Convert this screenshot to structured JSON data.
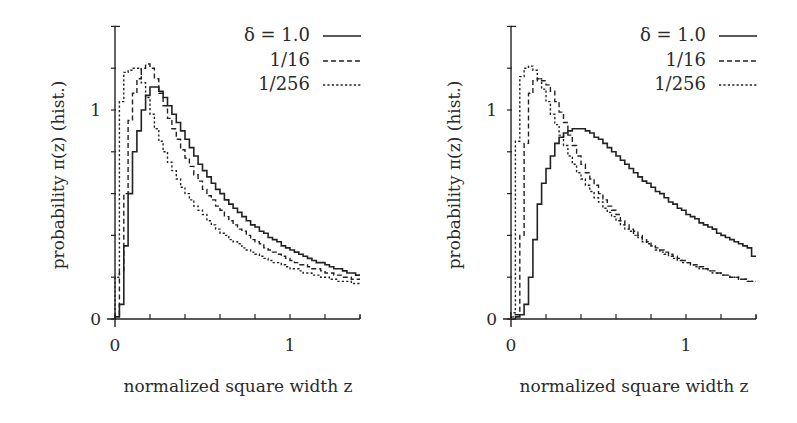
{
  "figure": {
    "panels": [
      {
        "id": "left",
        "ylabel": "probability π(z) (hist.)",
        "xlabel": "normalized square width z",
        "xticks": [
          {
            "value": 0,
            "label": "0"
          },
          {
            "value": 1,
            "label": "1"
          }
        ],
        "yticks": [
          {
            "value": 0,
            "label": "0"
          },
          {
            "value": 1,
            "label": "1"
          }
        ],
        "legend": [
          {
            "label": "δ = 1.0",
            "style": "solid"
          },
          {
            "label": "1/16",
            "style": "dashed"
          },
          {
            "label": "1/256",
            "style": "dotted"
          }
        ]
      },
      {
        "id": "right",
        "ylabel": "probability π(z) (hist.)",
        "xlabel": "normalized square width z",
        "xticks": [
          {
            "value": 0,
            "label": "0"
          },
          {
            "value": 1,
            "label": "1"
          }
        ],
        "yticks": [
          {
            "value": 0,
            "label": "0"
          },
          {
            "value": 1,
            "label": "1"
          }
        ],
        "legend": [
          {
            "label": "δ = 1.0",
            "style": "solid"
          },
          {
            "label": "1/16",
            "style": "dashed"
          },
          {
            "label": "1/256",
            "style": "dotted"
          }
        ]
      }
    ]
  },
  "chart_data": [
    {
      "type": "line",
      "subtype": "step-histogram",
      "title": "",
      "xlabel": "normalized square width z",
      "ylabel": "probability π(z) (hist.)",
      "xlim": [
        0,
        1.4
      ],
      "ylim": [
        0,
        1.4
      ],
      "x_major_ticks": [
        0,
        1
      ],
      "x_minor_ticks": [
        0.2,
        0.4,
        0.6,
        0.8,
        1.2,
        1.4
      ],
      "y_major_ticks": [
        0,
        1
      ],
      "y_minor_ticks": [
        0.2,
        0.4,
        0.6,
        0.8,
        1.2,
        1.4
      ],
      "grid": false,
      "legend_position": "upper right",
      "bin_width": 0.025,
      "x": [
        0.0,
        0.025,
        0.05,
        0.075,
        0.1,
        0.125,
        0.15,
        0.175,
        0.2,
        0.225,
        0.25,
        0.275,
        0.3,
        0.325,
        0.35,
        0.375,
        0.4,
        0.425,
        0.45,
        0.475,
        0.5,
        0.525,
        0.55,
        0.575,
        0.6,
        0.625,
        0.65,
        0.675,
        0.7,
        0.725,
        0.75,
        0.775,
        0.8,
        0.825,
        0.85,
        0.875,
        0.9,
        0.925,
        0.95,
        0.975,
        1.0,
        1.025,
        1.05,
        1.075,
        1.1,
        1.125,
        1.15,
        1.175,
        1.2,
        1.225,
        1.25,
        1.275,
        1.3,
        1.325,
        1.35,
        1.375
      ],
      "series": [
        {
          "name": "δ = 1.0",
          "style": "solid",
          "values": [
            0.01,
            0.07,
            0.35,
            0.6,
            0.8,
            0.9,
            1.0,
            1.07,
            1.11,
            1.11,
            1.09,
            1.06,
            1.02,
            0.98,
            0.94,
            0.9,
            0.86,
            0.82,
            0.78,
            0.74,
            0.71,
            0.68,
            0.65,
            0.62,
            0.6,
            0.57,
            0.55,
            0.53,
            0.51,
            0.49,
            0.47,
            0.45,
            0.44,
            0.42,
            0.41,
            0.39,
            0.38,
            0.37,
            0.35,
            0.34,
            0.33,
            0.32,
            0.31,
            0.3,
            0.29,
            0.28,
            0.27,
            0.27,
            0.26,
            0.25,
            0.24,
            0.24,
            0.23,
            0.22,
            0.22,
            0.21
          ]
        },
        {
          "name": "1/16",
          "style": "dashed",
          "values": [
            0.02,
            0.23,
            0.6,
            0.95,
            1.08,
            1.15,
            1.2,
            1.22,
            1.2,
            1.15,
            1.08,
            1.02,
            0.96,
            0.91,
            0.86,
            0.81,
            0.77,
            0.73,
            0.69,
            0.66,
            0.62,
            0.59,
            0.57,
            0.54,
            0.52,
            0.49,
            0.47,
            0.45,
            0.43,
            0.42,
            0.4,
            0.38,
            0.37,
            0.36,
            0.34,
            0.33,
            0.32,
            0.31,
            0.3,
            0.29,
            0.28,
            0.27,
            0.26,
            0.26,
            0.25,
            0.24,
            0.24,
            0.23,
            0.22,
            0.22,
            0.21,
            0.21,
            0.2,
            0.2,
            0.19,
            0.19
          ]
        },
        {
          "name": "1/256",
          "style": "dotted",
          "values": [
            0.2,
            1.04,
            1.18,
            1.19,
            1.2,
            1.2,
            1.13,
            1.06,
            0.98,
            0.91,
            0.85,
            0.8,
            0.75,
            0.71,
            0.67,
            0.63,
            0.6,
            0.57,
            0.54,
            0.52,
            0.5,
            0.47,
            0.45,
            0.43,
            0.41,
            0.4,
            0.38,
            0.37,
            0.36,
            0.34,
            0.33,
            0.32,
            0.31,
            0.3,
            0.29,
            0.28,
            0.27,
            0.27,
            0.26,
            0.25,
            0.24,
            0.24,
            0.23,
            0.22,
            0.22,
            0.21,
            0.21,
            0.2,
            0.2,
            0.19,
            0.19,
            0.18,
            0.18,
            0.18,
            0.17,
            0.17
          ]
        }
      ]
    },
    {
      "type": "line",
      "subtype": "step-histogram",
      "title": "",
      "xlabel": "normalized square width z",
      "ylabel": "probability π(z) (hist.)",
      "xlim": [
        0,
        1.4
      ],
      "ylim": [
        0,
        1.4
      ],
      "x_major_ticks": [
        0,
        1
      ],
      "x_minor_ticks": [
        0.2,
        0.4,
        0.6,
        0.8,
        1.2,
        1.4
      ],
      "y_major_ticks": [
        0,
        1
      ],
      "y_minor_ticks": [
        0.2,
        0.4,
        0.6,
        0.8,
        1.2,
        1.4
      ],
      "grid": false,
      "legend_position": "upper right",
      "bin_width": 0.025,
      "x": [
        0.0,
        0.025,
        0.05,
        0.075,
        0.1,
        0.125,
        0.15,
        0.175,
        0.2,
        0.225,
        0.25,
        0.275,
        0.3,
        0.325,
        0.35,
        0.375,
        0.4,
        0.425,
        0.45,
        0.475,
        0.5,
        0.525,
        0.55,
        0.575,
        0.6,
        0.625,
        0.65,
        0.675,
        0.7,
        0.725,
        0.75,
        0.775,
        0.8,
        0.825,
        0.85,
        0.875,
        0.9,
        0.925,
        0.95,
        0.975,
        1.0,
        1.025,
        1.05,
        1.075,
        1.1,
        1.125,
        1.15,
        1.175,
        1.2,
        1.225,
        1.25,
        1.275,
        1.3,
        1.325,
        1.35,
        1.375
      ],
      "series": [
        {
          "name": "δ = 1.0",
          "style": "solid",
          "values": [
            0.0,
            0.01,
            0.02,
            0.07,
            0.2,
            0.38,
            0.55,
            0.65,
            0.72,
            0.78,
            0.84,
            0.87,
            0.89,
            0.9,
            0.91,
            0.91,
            0.91,
            0.9,
            0.89,
            0.87,
            0.86,
            0.84,
            0.82,
            0.8,
            0.78,
            0.76,
            0.74,
            0.72,
            0.7,
            0.68,
            0.66,
            0.65,
            0.63,
            0.61,
            0.6,
            0.58,
            0.56,
            0.55,
            0.53,
            0.52,
            0.5,
            0.49,
            0.48,
            0.46,
            0.45,
            0.44,
            0.43,
            0.41,
            0.4,
            0.39,
            0.38,
            0.37,
            0.36,
            0.35,
            0.34,
            0.3
          ]
        },
        {
          "name": "1/16",
          "style": "dashed",
          "values": [
            0.01,
            0.02,
            0.4,
            0.84,
            1.08,
            1.14,
            1.15,
            1.14,
            1.12,
            1.09,
            1.04,
            0.99,
            0.94,
            0.88,
            0.83,
            0.78,
            0.74,
            0.7,
            0.67,
            0.64,
            0.6,
            0.57,
            0.54,
            0.52,
            0.5,
            0.47,
            0.45,
            0.43,
            0.42,
            0.4,
            0.38,
            0.37,
            0.35,
            0.34,
            0.33,
            0.32,
            0.31,
            0.3,
            0.29,
            0.28,
            0.27,
            0.26,
            0.26,
            0.25,
            0.24,
            0.23,
            0.23,
            0.22,
            0.21,
            0.21,
            0.2,
            0.2,
            0.19,
            0.19,
            0.18,
            0.18
          ]
        },
        {
          "name": "1/256",
          "style": "dotted",
          "values": [
            0.03,
            0.85,
            1.16,
            1.2,
            1.21,
            1.19,
            1.15,
            1.1,
            1.04,
            0.98,
            0.93,
            0.88,
            0.83,
            0.78,
            0.74,
            0.7,
            0.67,
            0.64,
            0.61,
            0.58,
            0.56,
            0.53,
            0.51,
            0.49,
            0.47,
            0.45,
            0.43,
            0.42,
            0.4,
            0.39,
            0.37,
            0.36,
            0.35,
            0.33,
            0.32,
            0.31,
            0.3,
            0.29,
            0.28,
            0.27,
            0.27,
            0.26,
            0.25,
            0.24,
            0.24,
            0.23,
            0.22,
            0.22,
            0.21,
            0.21,
            0.2,
            0.2,
            0.19,
            0.19,
            0.18,
            0.18
          ]
        }
      ]
    }
  ]
}
